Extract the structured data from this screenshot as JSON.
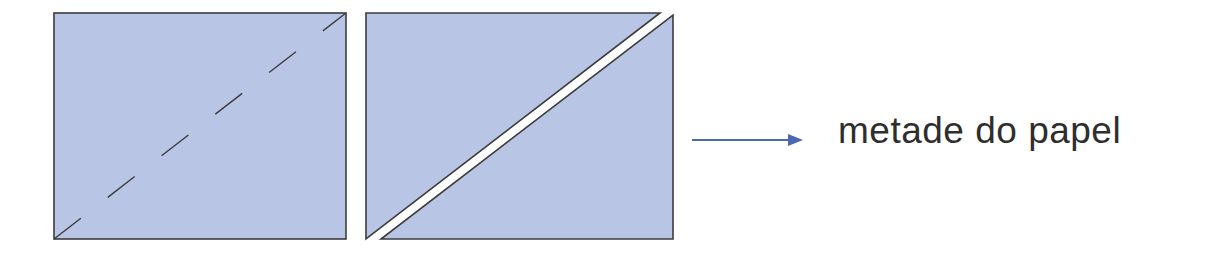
{
  "diagram": {
    "label": "metade do papel",
    "colors": {
      "paper_fill": "#b9c5e5",
      "outline": "#3c3c3c",
      "arrow": "#4a68b0",
      "text": "#2e2e2e",
      "cut_gap": "#ffffff"
    },
    "panels": [
      {
        "name": "folded-paper",
        "fold_line": "dashed-diagonal"
      },
      {
        "name": "cut-paper",
        "cut": "diagonal-split-into-two-triangles"
      }
    ]
  }
}
